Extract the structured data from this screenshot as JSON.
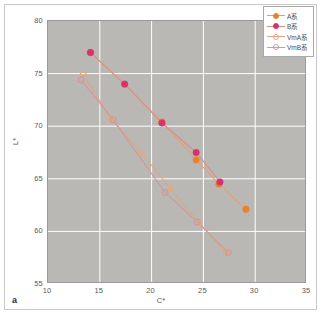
{
  "panel": {
    "tag": "a"
  },
  "chart_data": {
    "type": "scatter",
    "title": "",
    "subtitle": "",
    "xlabel": "C*",
    "ylabel": "L*",
    "xlim": [
      10,
      35
    ],
    "ylim": [
      55,
      80
    ],
    "xticks": [
      "10",
      "15",
      "20",
      "25",
      "30",
      "35"
    ],
    "yticks": [
      "80",
      "75",
      "70",
      "65",
      "60",
      "55"
    ],
    "xtick_values": [
      10,
      15,
      20,
      25,
      30,
      35
    ],
    "ytick_values": [
      80,
      75,
      70,
      65,
      60,
      55
    ],
    "grid": true,
    "grid_color": "#ffffff",
    "plot_background": "#b9b8b4",
    "legend_position": "top-right",
    "series": [
      {
        "name": "A系",
        "marker": "filled-circle",
        "color": "#e8822a",
        "line_color": "#e8a070",
        "points": [
          {
            "x": 14.1,
            "y": 77.0
          },
          {
            "x": 17.4,
            "y": 74.0
          },
          {
            "x": 21.0,
            "y": 70.4
          },
          {
            "x": 24.3,
            "y": 66.8
          },
          {
            "x": 26.5,
            "y": 64.5
          },
          {
            "x": 29.1,
            "y": 62.1
          }
        ]
      },
      {
        "name": "B系",
        "marker": "filled-circle",
        "color": "#d6326e",
        "line_color": "#dd8f86",
        "points": [
          {
            "x": 14.1,
            "y": 77.0
          },
          {
            "x": 17.4,
            "y": 74.0
          },
          {
            "x": 21.0,
            "y": 70.3
          },
          {
            "x": 24.3,
            "y": 67.5
          },
          {
            "x": 26.6,
            "y": 64.7
          }
        ]
      },
      {
        "name": "VmA系",
        "marker": "open-circle",
        "color": "#e8a878",
        "line_color": "#e0a684",
        "points": [
          {
            "x": 13.4,
            "y": 74.9
          },
          {
            "x": 16.1,
            "y": 70.7
          },
          {
            "x": 19.0,
            "y": 67.5
          },
          {
            "x": 21.8,
            "y": 64.1
          },
          {
            "x": 24.5,
            "y": 60.9
          },
          {
            "x": 27.2,
            "y": 58.0
          }
        ]
      },
      {
        "name": "VmB系",
        "marker": "open-circle",
        "color": "#cf9a9c",
        "line_color": "#cf9a9c",
        "points": [
          {
            "x": 13.2,
            "y": 74.4
          },
          {
            "x": 16.3,
            "y": 70.6
          },
          {
            "x": 21.3,
            "y": 63.7
          },
          {
            "x": 24.4,
            "y": 60.9
          },
          {
            "x": 27.4,
            "y": 58.0
          }
        ]
      }
    ]
  }
}
